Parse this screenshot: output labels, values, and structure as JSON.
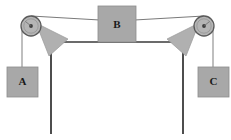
{
  "figure": {
    "width": 231,
    "height": 140,
    "background_color": "#ffffff"
  },
  "colors": {
    "block_fill": "#a8a8a8",
    "block_stroke": "#6e6e6e",
    "bracket_fill": "#b0b0b0",
    "bracket_stroke": "#8a8a8a",
    "pulley_fill": "#b5b5b5",
    "pulley_stroke": "#5a5a5a",
    "pulley_hub_fill": "#4a4a4a",
    "rope_color": "#7a7a7a",
    "post_color": "#4d4d4d",
    "beam_color": "#6b6b6b",
    "label_color": "#1a1a1a"
  },
  "blocks": [
    {
      "id": "block-a",
      "label": "A",
      "x": 12,
      "y": 67,
      "width": 32,
      "height": 30,
      "position_note": "left hanging block"
    },
    {
      "id": "block-b",
      "label": "B",
      "x": 98,
      "y": 6,
      "width": 38,
      "height": 36,
      "position_note": "center block on beam"
    },
    {
      "id": "block-c",
      "label": "C",
      "x": 190,
      "y": 67,
      "width": 32,
      "height": 30,
      "position_note": "right hanging block"
    }
  ],
  "pulleys": [
    {
      "id": "pulley-left",
      "cx": 31,
      "cy": 26,
      "radius": 10,
      "hub_radius": 2,
      "position_note": "left top pulley"
    },
    {
      "id": "pulley-right",
      "cx": 204,
      "cy": 26,
      "radius": 10,
      "hub_radius": 2,
      "position_note": "right top pulley"
    }
  ],
  "brackets": [
    {
      "id": "bracket-left",
      "points": "38,24 66,39 48,55",
      "position_note": "left triangular gusset bracket"
    },
    {
      "id": "bracket-right",
      "points": "197,24 169,39 187,55",
      "position_note": "right triangular gusset bracket"
    }
  ],
  "posts": [
    {
      "id": "post-left",
      "x": 51,
      "y_top": 48,
      "y_bottom": 134,
      "position_note": "left vertical support post"
    },
    {
      "id": "post-right",
      "x": 183,
      "y_top": 48,
      "y_bottom": 134,
      "position_note": "right vertical support post"
    }
  ],
  "beams": [
    {
      "id": "beam-horizontal",
      "x1": 51,
      "y1": 42,
      "x2": 183,
      "y2": 42,
      "position_note": "horizontal beam supporting block B"
    }
  ],
  "ropes": [
    {
      "id": "rope-top-left",
      "x1": 31,
      "y1": 16,
      "x2": 117,
      "y2": 21,
      "position_note": "rope from left pulley top to block B"
    },
    {
      "id": "rope-top-right",
      "x1": 117,
      "y1": 21,
      "x2": 204,
      "y2": 16,
      "position_note": "rope from block B to right pulley top"
    },
    {
      "id": "rope-left-vertical",
      "x1": 22,
      "y1": 28,
      "x2": 22,
      "y2": 67,
      "position_note": "rope from left pulley down to block A"
    },
    {
      "id": "rope-right-vertical",
      "x1": 213,
      "y1": 28,
      "x2": 213,
      "y2": 67,
      "position_note": "rope from right pulley down to block C"
    }
  ]
}
